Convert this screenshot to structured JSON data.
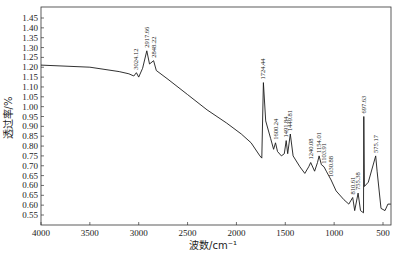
{
  "chart_data": {
    "type": "line",
    "title": "",
    "xlabel": "波数/cm⁻¹",
    "ylabel": "透过率/%",
    "xlim": [
      4000,
      420
    ],
    "ylim": [
      0.5,
      1.5
    ],
    "x_reversed": true,
    "grid": false,
    "legend": null,
    "x_ticks": [
      4000,
      3500,
      3000,
      2500,
      2000,
      1500,
      1000,
      500
    ],
    "y_tick_labels": [
      "1.45",
      "1.40",
      "1.35",
      "1.30",
      "1.25",
      "1.20",
      "1.15",
      "1.10",
      "1.05",
      "1.00",
      "0.95",
      "0.90",
      "0.85",
      "0.80",
      "0.75",
      "0.70",
      "0.65",
      "0.60",
      "0.65",
      "0.60",
      "0.55"
    ],
    "series": [
      {
        "name": "FTIR spectrum",
        "color": "#1a1a1a",
        "x": [
          4000,
          3500,
          3200,
          3100,
          3050,
          3024,
          3000,
          2960,
          2917,
          2890,
          2848,
          2820,
          2700,
          2500,
          2300,
          2100,
          1950,
          1850,
          1760,
          1740,
          1724,
          1700,
          1650,
          1620,
          1600,
          1580,
          1540,
          1510,
          1491,
          1475,
          1449,
          1420,
          1350,
          1300,
          1260,
          1240,
          1200,
          1170,
          1154,
          1130,
          1104,
          1080,
          1031,
          980,
          900,
          850,
          810,
          790,
          755,
          730,
          700,
          697,
          690,
          650,
          575,
          560,
          520,
          480,
          450,
          420
        ],
        "y": [
          1.235,
          1.225,
          1.205,
          1.195,
          1.185,
          1.2,
          1.18,
          1.22,
          1.3,
          1.24,
          1.255,
          1.21,
          1.17,
          1.1,
          1.03,
          0.97,
          0.92,
          0.88,
          0.82,
          0.81,
          1.155,
          0.98,
          0.9,
          0.85,
          0.88,
          0.84,
          0.82,
          0.83,
          0.89,
          0.83,
          0.92,
          0.82,
          0.77,
          0.74,
          0.77,
          0.79,
          0.75,
          0.79,
          0.82,
          0.78,
          0.77,
          0.75,
          0.71,
          0.66,
          0.62,
          0.6,
          0.63,
          0.57,
          0.65,
          0.57,
          0.56,
          1.0,
          0.68,
          0.7,
          0.82,
          0.75,
          0.58,
          0.57,
          0.6,
          0.6
        ]
      }
    ],
    "annotations": [
      {
        "text": "3024.12",
        "x": 3024,
        "y": 1.2
      },
      {
        "text": "2917.66",
        "x": 2917,
        "y": 1.3
      },
      {
        "text": "2848.22",
        "x": 2848,
        "y": 1.255
      },
      {
        "text": "1724.44",
        "x": 1724,
        "y": 1.155
      },
      {
        "text": "1600.24",
        "x": 1600,
        "y": 0.88
      },
      {
        "text": "1491.84",
        "x": 1491,
        "y": 0.89
      },
      {
        "text": "1449.81",
        "x": 1449,
        "y": 0.92
      },
      {
        "text": "1240.08",
        "x": 1240,
        "y": 0.79
      },
      {
        "text": "1154.01",
        "x": 1154,
        "y": 0.82
      },
      {
        "text": "1103.91",
        "x": 1104,
        "y": 0.77
      },
      {
        "text": "1030.88",
        "x": 1031,
        "y": 0.71
      },
      {
        "text": "810.61",
        "x": 810,
        "y": 0.63
      },
      {
        "text": "755.38",
        "x": 755,
        "y": 0.65
      },
      {
        "text": "697.63",
        "x": 697,
        "y": 1.0
      },
      {
        "text": "575.17",
        "x": 575,
        "y": 0.82
      }
    ]
  }
}
